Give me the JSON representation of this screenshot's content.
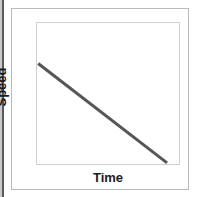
{
  "figure": {
    "background_color": "#ffffff",
    "outer_frame_color": "#b9b9bb",
    "plot_frame_color": "#cfcfd2",
    "page_edge_color": "#59595c"
  },
  "labels": {
    "y_axis": "Speed",
    "x_axis": "Time"
  },
  "chart_data": {
    "type": "line",
    "title": "",
    "subtitle": "",
    "xlabel": "Time",
    "ylabel": "Speed",
    "xlim": [
      0,
      10
    ],
    "ylim": [
      0,
      10
    ],
    "grid": false,
    "legend": false,
    "legend_position": "none",
    "x_tick_labels": [],
    "y_tick_labels": [],
    "annotations": [],
    "series": [
      {
        "name": "Speed",
        "color": "#55555a",
        "line_width": 3,
        "x": [
          0.15,
          9.1
        ],
        "y": [
          7.1,
          0.15
        ],
        "description": "Speed decreases linearly as time increases"
      }
    ]
  }
}
